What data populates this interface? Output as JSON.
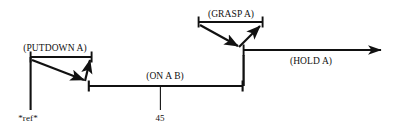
{
  "diagram": {
    "type": "temporal-interval-timeline",
    "background_color": "#ffffff",
    "stroke_color": "#111111",
    "labels": {
      "putdown": "(PUTDOWN A)",
      "grasp": "(GRASP A)",
      "on_a_b": "(ON A B)",
      "hold": "(HOLD A)",
      "ref": "*ref*",
      "time_45": "45"
    },
    "intervals": [
      {
        "name": "putdown-a",
        "label": "(PUTDOWN A)",
        "kind": "bracket",
        "x_start": 30,
        "x_end": 92,
        "y": 57
      },
      {
        "name": "grasp-a",
        "label": "(GRASP A)",
        "kind": "bracket",
        "x_start": 198,
        "x_end": 263,
        "y": 22
      },
      {
        "name": "on-a-b",
        "label": "(ON A B)",
        "kind": "bar",
        "x_start": 88,
        "x_end": 243,
        "y": 86
      },
      {
        "name": "hold-a",
        "label": "(HOLD A)",
        "kind": "arrow",
        "x_start": 243,
        "x_end": 388,
        "y": 50
      }
    ],
    "reference_marks": [
      {
        "name": "ref-marker",
        "label": "*ref*",
        "x": 30,
        "y_top": 57,
        "y_bottom": 110
      },
      {
        "name": "time-45-tick",
        "label": "45",
        "x": 160,
        "y_top": 86,
        "y_bottom": 110
      }
    ],
    "connectors": [
      {
        "name": "grasp-to-on-a-b-connector",
        "x": 243,
        "y_top": 50,
        "y_bottom": 86
      }
    ],
    "relation_arrows": [
      {
        "name": "putdown-start-arrow",
        "from_x": 30,
        "from_y": 59,
        "to_x": 86,
        "to_y": 82
      },
      {
        "name": "putdown-end-arrow",
        "from_x": 86,
        "from_y": 82,
        "to_x": 91,
        "to_y": 59
      },
      {
        "name": "grasp-start-arrow",
        "from_x": 198,
        "from_y": 24,
        "to_x": 241,
        "to_y": 48
      },
      {
        "name": "grasp-end-arrow",
        "from_x": 241,
        "from_y": 48,
        "to_x": 262,
        "to_y": 24
      }
    ]
  }
}
